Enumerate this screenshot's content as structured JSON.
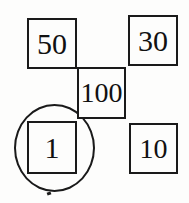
{
  "diagram": {
    "background_color": "#fdfdfc",
    "stroke_color": "#1a1a1a",
    "text_color": "#111111",
    "nodes": [
      {
        "id": "node-50",
        "label": "50",
        "x": 27,
        "y": 18,
        "width": 50,
        "height": 51,
        "shape": "square"
      },
      {
        "id": "node-30",
        "label": "30",
        "x": 128,
        "y": 15,
        "width": 50,
        "height": 51,
        "shape": "square"
      },
      {
        "id": "node-100",
        "label": "100",
        "x": 77,
        "y": 67,
        "width": 49,
        "height": 52,
        "shape": "square"
      },
      {
        "id": "node-1",
        "label": "1",
        "x": 27,
        "y": 121,
        "width": 50,
        "height": 53,
        "shape": "square"
      },
      {
        "id": "node-10",
        "label": "10",
        "x": 129,
        "y": 123,
        "width": 49,
        "height": 51,
        "shape": "square"
      }
    ],
    "annotations": [
      {
        "id": "selection-circle",
        "type": "circle",
        "targets_node": "node-1",
        "x": 14,
        "y": 104,
        "width": 81,
        "height": 88
      },
      {
        "id": "circle-tick",
        "type": "tick",
        "x": 47,
        "y": 192,
        "width": 4,
        "height": 3
      }
    ]
  }
}
